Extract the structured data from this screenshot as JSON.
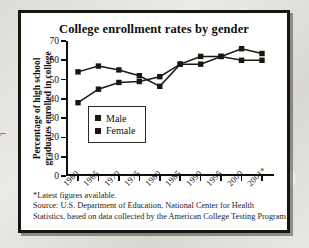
{
  "figure": {
    "title": "College enrollment rates by gender",
    "stray_mark": "⌐"
  },
  "axes": {
    "y_title_line1": "Percentage of high school",
    "y_title_line2": "graduates enrolled in college",
    "y_ticks": [
      "0",
      "10",
      "20",
      "30",
      "40",
      "50",
      "60",
      "70"
    ],
    "x_ticks": [
      "1960",
      "1965",
      "1970",
      "1975",
      "1980",
      "1985",
      "1990",
      "1995",
      "2000",
      "2001*"
    ]
  },
  "legend": {
    "position": "inside-lower-left",
    "entries": [
      {
        "label": "Male",
        "color": "#181710",
        "marker": "square"
      },
      {
        "label": "Female",
        "color": "#181710",
        "marker": "square"
      }
    ]
  },
  "footnotes": {
    "line1": "*Latest figures available.",
    "line2": "Source: U.S. Department of Education, National Center for Health",
    "line3": "Statistics, based on data collected by the American College Testing Program."
  },
  "chart_data": {
    "type": "line",
    "title": "College enrollment rates by gender",
    "xlabel": "",
    "ylabel": "Percentage of high school graduates enrolled in college",
    "categories": [
      "1960",
      "1965",
      "1970",
      "1975",
      "1980",
      "1985",
      "1990",
      "1995",
      "2000",
      "2001*"
    ],
    "ylim": [
      0,
      70
    ],
    "ytick_step": 10,
    "grid": false,
    "legend_position": "inside-lower-left",
    "marker": "square",
    "series": [
      {
        "name": "Male",
        "color": "#181710",
        "values": [
          38,
          45,
          48.5,
          49,
          51.5,
          58,
          58,
          62,
          60,
          60
        ]
      },
      {
        "name": "Female",
        "color": "#181710",
        "values": [
          54,
          57,
          55,
          52,
          46.5,
          58,
          62,
          62,
          66,
          63.5
        ]
      }
    ],
    "annotations": [
      "*Latest figures available.",
      "Source: U.S. Department of Education, National Center for Health Statistics, based on data collected by the American College Testing Program."
    ]
  }
}
